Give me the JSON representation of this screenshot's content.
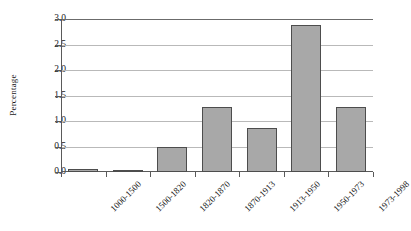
{
  "chart_data": {
    "type": "bar",
    "title": "",
    "subtitle": "",
    "xlabel": "",
    "ylabel": "Percentage",
    "categories": [
      "1000-1500",
      "1500-1820",
      "1820-1870",
      "1870-1913",
      "1913-1950",
      "1950-1973",
      "1973-1998"
    ],
    "values": [
      0.05,
      0.04,
      0.5,
      1.27,
      0.87,
      2.88,
      1.27
    ],
    "ylim": [
      0.0,
      3.0
    ],
    "ytick_values": [
      0.0,
      0.5,
      1.0,
      1.5,
      2.0,
      2.5,
      3.0
    ],
    "ytick_labels": [
      "0.0",
      "0.5",
      "1.0",
      "1.5",
      "2.0",
      "2.5",
      "3.0"
    ],
    "grid": "horizontal",
    "legend": "none",
    "bar_color": "#a8a8a8",
    "bar_border_color": "#4d4d4d",
    "gridline_color": "#b9b9b9",
    "axis_color": "#5a5a5a",
    "background_color": "#ffffff",
    "xtick_label_rotation": 45
  }
}
